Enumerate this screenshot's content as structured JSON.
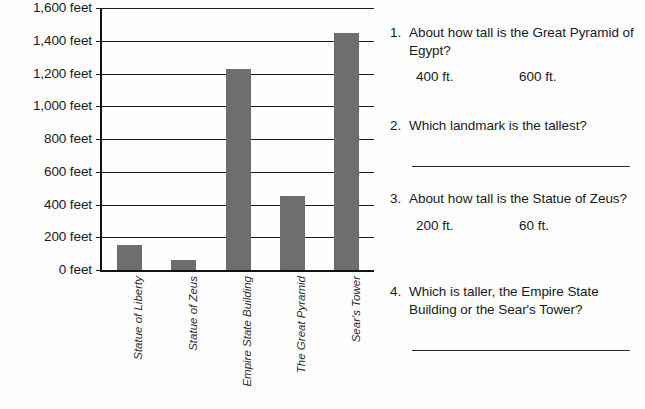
{
  "chart_data": {
    "type": "bar",
    "title": "",
    "subtitle": "",
    "xlabel": "",
    "ylabel": "",
    "categories": [
      "Statue of Liberty",
      "Statue of Zeus",
      "Empire State Building",
      "The Great Pyramid",
      "Sear's Tower"
    ],
    "values": [
      150,
      60,
      1230,
      450,
      1450
    ],
    "unit": "feet",
    "ylim": [
      0,
      1600
    ],
    "ytick_step": 200,
    "ytick_labels": [
      "0 feet",
      "200 feet",
      "400 feet",
      "600 feet",
      "800 feet",
      "1,000 feet",
      "1,200 feet",
      "1,400 feet",
      "1,600 feet"
    ],
    "ytick_values": [
      0,
      200,
      400,
      600,
      800,
      1000,
      1200,
      1400,
      1600
    ],
    "grid": true,
    "grid_axis": "y",
    "legend": false,
    "legend_position": "none",
    "bar_color": "#6e6e6e",
    "axis_color": "#111111",
    "background_color": "#ffffff"
  },
  "questions": [
    {
      "number": "1.",
      "text": "About how tall is the Great Pyramid of Egypt?",
      "choices": [
        "400 ft.",
        "600 ft."
      ],
      "answer_line": false
    },
    {
      "number": "2.",
      "text": "Which landmark is the tallest?",
      "choices": [],
      "answer_line": true
    },
    {
      "number": "3.",
      "text": "About how tall is the Statue of Zeus?",
      "choices": [
        "200 ft.",
        "60 ft."
      ],
      "answer_line": false
    },
    {
      "number": "4.",
      "text": "Which is taller, the Empire State Building or the Sear's Tower?",
      "choices": [],
      "answer_line": true
    }
  ]
}
